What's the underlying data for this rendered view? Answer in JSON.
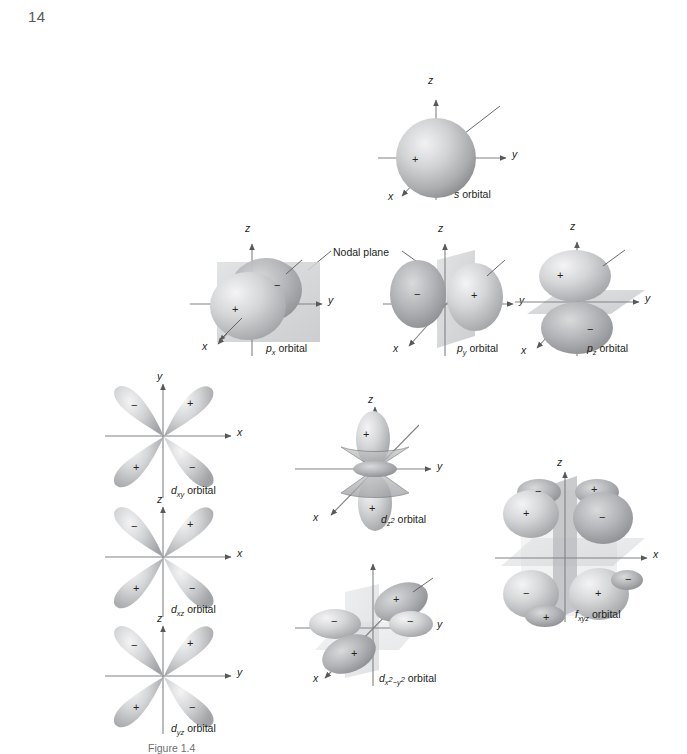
{
  "page": {
    "number": "14",
    "caption": "Figure 1.4",
    "background": "#ffffff",
    "ink": "#231f20"
  },
  "colors": {
    "lobe_light": "#d8d9db",
    "lobe_mid": "#b4b6b8",
    "lobe_dark": "#8e9093",
    "plane_fill": "#d4d6d8",
    "axis": "#808285",
    "leader": "#58595b"
  },
  "annotations": {
    "nodal_plane_label": "Nodal plane"
  },
  "orbitals": [
    {
      "id": "s",
      "label_plain": "s orbital",
      "label_symbol": "s",
      "label_sub": "",
      "label_sup": "",
      "type": "sphere",
      "axes": [
        "z",
        "y",
        "x"
      ],
      "signs": [
        "+"
      ],
      "nodal_planes": 0,
      "lobes": 1
    },
    {
      "id": "px",
      "label_plain": "px orbital",
      "label_symbol": "p",
      "label_sub": "x",
      "label_sup": "",
      "type": "dumbbell",
      "axes": [
        "z",
        "y",
        "x"
      ],
      "signs": [
        "+",
        "−"
      ],
      "nodal_planes": 1,
      "lobes": 2,
      "orientation": "x"
    },
    {
      "id": "py",
      "label_plain": "py orbital",
      "label_symbol": "p",
      "label_sub": "y",
      "label_sup": "",
      "type": "dumbbell",
      "axes": [
        "z",
        "y",
        "x"
      ],
      "signs": [
        "−",
        "+"
      ],
      "nodal_planes": 1,
      "lobes": 2,
      "orientation": "y"
    },
    {
      "id": "pz",
      "label_plain": "pz orbital",
      "label_symbol": "p",
      "label_sub": "z",
      "label_sup": "",
      "type": "dumbbell",
      "axes": [
        "z",
        "y",
        "x"
      ],
      "signs": [
        "+",
        "−"
      ],
      "nodal_planes": 1,
      "lobes": 2,
      "orientation": "z"
    },
    {
      "id": "dxy",
      "label_plain": "dxy orbital",
      "label_symbol": "d",
      "label_sub": "xy",
      "label_sup": "",
      "type": "cloverleaf",
      "axes": [
        "y",
        "x"
      ],
      "signs": [
        "−",
        "+",
        "+",
        "−"
      ],
      "nodal_planes": 2,
      "lobes": 4
    },
    {
      "id": "dxz",
      "label_plain": "dxz orbital",
      "label_symbol": "d",
      "label_sub": "xz",
      "label_sup": "",
      "type": "cloverleaf",
      "axes": [
        "z",
        "x"
      ],
      "signs": [
        "−",
        "+",
        "+",
        "−"
      ],
      "nodal_planes": 2,
      "lobes": 4
    },
    {
      "id": "dyz",
      "label_plain": "dyz orbital",
      "label_symbol": "d",
      "label_sub": "yz",
      "label_sup": "",
      "type": "cloverleaf",
      "axes": [
        "z",
        "y"
      ],
      "signs": [
        "−",
        "+",
        "+",
        "−"
      ],
      "nodal_planes": 2,
      "lobes": 4
    },
    {
      "id": "dz2",
      "label_plain": "dz2 orbital",
      "label_symbol": "d",
      "label_sub": "z",
      "label_sup": "2",
      "type": "dz2",
      "axes": [
        "z",
        "y",
        "x"
      ],
      "signs": [
        "+",
        "+"
      ],
      "nodal_planes": 2,
      "lobes": 2,
      "has_torus": true
    },
    {
      "id": "dx2y2",
      "label_plain": "dx2-y2 orbital",
      "label_symbol": "d",
      "label_sub_parts": [
        "x",
        "2",
        "−",
        "y",
        "2"
      ],
      "type": "cloverleaf-3d",
      "axes": [
        "z",
        "y",
        "x"
      ],
      "signs": [
        "+",
        "−",
        "−",
        "+"
      ],
      "nodal_planes": 2,
      "lobes": 4
    },
    {
      "id": "fxyz",
      "label_plain": "fxyz orbital",
      "label_symbol": "f",
      "label_sub": "xyz",
      "label_sup": "",
      "type": "octant",
      "axes": [
        "z",
        "x"
      ],
      "signs": [
        "+",
        "−",
        "+",
        "−",
        "−",
        "+",
        "−",
        "+"
      ],
      "nodal_planes": 3,
      "lobes": 8
    }
  ]
}
